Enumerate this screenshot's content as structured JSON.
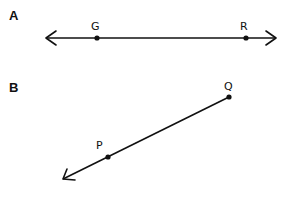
{
  "figures": [
    {
      "label": "A",
      "type": "line",
      "description": "Line through points G and R with arrows at both ends",
      "points": [
        {
          "name": "G",
          "x": 97,
          "y": 38
        },
        {
          "name": "R",
          "x": 246,
          "y": 38
        }
      ],
      "endpoints": {
        "start": [
          46,
          38
        ],
        "end": [
          276,
          38
        ]
      },
      "arrows": [
        "start",
        "end"
      ]
    },
    {
      "label": "B",
      "type": "ray",
      "description": "Ray starting at Q passing through P, arrow pointing down-left",
      "points": [
        {
          "name": "Q",
          "x": 229,
          "y": 97
        },
        {
          "name": "P",
          "x": 108,
          "y": 157
        }
      ],
      "endpoints": {
        "start": [
          229,
          97
        ],
        "end": [
          63,
          179
        ]
      },
      "arrows": [
        "end"
      ]
    }
  ],
  "colors": {
    "stroke": "#111111",
    "background": "#ffffff"
  }
}
